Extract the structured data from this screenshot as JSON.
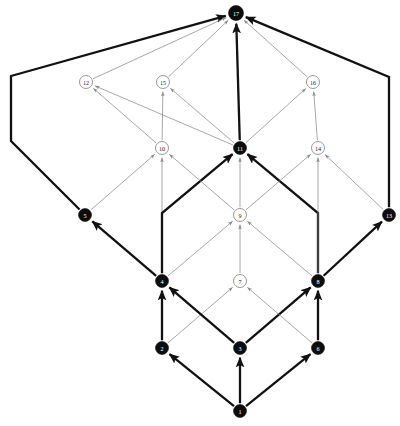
{
  "figure": {
    "title": "",
    "background_color": "#ffffff",
    "width": 400,
    "height": 426
  },
  "style": {
    "black_node_fill": "#0d0d0d",
    "black_node_label_color": "#ffffff",
    "white_node_fill": "#ffffff",
    "white_node_stroke": "#7d7d7d",
    "white_node_label_color": "#222222",
    "thin_edge_color": "#8a8a8a",
    "thick_edge_color": "#111111",
    "thin_edge_width": 0.75,
    "thick_edge_width": 2.3
  },
  "chart_data": {
    "type": "diagram",
    "subtype": "directed-acyclic-graph",
    "title": "",
    "node_count": 17,
    "edge_count": 34,
    "nodes": [
      {
        "id": 1,
        "label": "1",
        "x": 240,
        "y": 411,
        "fill": "black",
        "r": 6.5
      },
      {
        "id": 2,
        "label": "2",
        "x": 162,
        "y": 348,
        "fill": "black",
        "r": 6.5
      },
      {
        "id": 3,
        "label": "3",
        "x": 240,
        "y": 348,
        "fill": "black",
        "r": 6.5
      },
      {
        "id": 4,
        "label": "4",
        "x": 162,
        "y": 281,
        "fill": "black",
        "r": 6.5
      },
      {
        "id": 5,
        "label": "5",
        "x": 85,
        "y": 215,
        "fill": "black",
        "r": 6.5
      },
      {
        "id": 6,
        "label": "6",
        "x": 318,
        "y": 348,
        "fill": "black",
        "r": 6.5
      },
      {
        "id": 7,
        "label": "7",
        "x": 240,
        "y": 281,
        "fill": "white",
        "r": 6.5
      },
      {
        "id": 8,
        "label": "8",
        "x": 318,
        "y": 281,
        "fill": "black",
        "r": 6.5
      },
      {
        "id": 9,
        "label": "9",
        "x": 240,
        "y": 215,
        "fill": "white",
        "r": 6.5
      },
      {
        "id": 10,
        "label": "10",
        "x": 162,
        "y": 148,
        "fill": "white",
        "r": 6.5
      },
      {
        "id": 11,
        "label": "11",
        "x": 240,
        "y": 148,
        "fill": "black",
        "r": 6.5
      },
      {
        "id": 12,
        "label": "12",
        "x": 86,
        "y": 82,
        "fill": "white",
        "r": 6.5
      },
      {
        "id": 13,
        "label": "13",
        "x": 389,
        "y": 215,
        "fill": "black",
        "r": 6.5
      },
      {
        "id": 14,
        "label": "14",
        "x": 318,
        "y": 148,
        "fill": "white",
        "r": 6.5
      },
      {
        "id": 15,
        "label": "15",
        "x": 163,
        "y": 82,
        "fill": "white",
        "r": 6.5
      },
      {
        "id": 16,
        "label": "16",
        "x": 313,
        "y": 82,
        "fill": "white",
        "r": 6.5
      },
      {
        "id": 17,
        "label": "17",
        "x": 236,
        "y": 13,
        "fill": "black",
        "r": 7.5
      }
    ],
    "edges": [
      {
        "from": 1,
        "to": 2,
        "weight": "thick",
        "shape": "straight"
      },
      {
        "from": 1,
        "to": 3,
        "weight": "thick",
        "shape": "straight"
      },
      {
        "from": 1,
        "to": 6,
        "weight": "thick",
        "shape": "straight"
      },
      {
        "from": 2,
        "to": 4,
        "weight": "thick",
        "shape": "straight"
      },
      {
        "from": 2,
        "to": 7,
        "weight": "thin",
        "shape": "straight"
      },
      {
        "from": 3,
        "to": 4,
        "weight": "thick",
        "shape": "straight"
      },
      {
        "from": 3,
        "to": 8,
        "weight": "thick",
        "shape": "straight"
      },
      {
        "from": 6,
        "to": 7,
        "weight": "thin",
        "shape": "straight"
      },
      {
        "from": 6,
        "to": 8,
        "weight": "thick",
        "shape": "straight"
      },
      {
        "from": 4,
        "to": 5,
        "weight": "thick",
        "shape": "straight"
      },
      {
        "from": 4,
        "to": 9,
        "weight": "thin",
        "shape": "straight"
      },
      {
        "from": 4,
        "to": 10,
        "weight": "thin",
        "shape": "straight"
      },
      {
        "from": 4,
        "to": 11,
        "weight": "thick",
        "shape": "elbow-up-right"
      },
      {
        "from": 7,
        "to": 9,
        "weight": "thin",
        "shape": "straight"
      },
      {
        "from": 8,
        "to": 9,
        "weight": "thin",
        "shape": "straight"
      },
      {
        "from": 8,
        "to": 11,
        "weight": "thick",
        "shape": "elbow-up-left"
      },
      {
        "from": 8,
        "to": 13,
        "weight": "thick",
        "shape": "straight"
      },
      {
        "from": 8,
        "to": 14,
        "weight": "thin",
        "shape": "straight"
      },
      {
        "from": 9,
        "to": 10,
        "weight": "thin",
        "shape": "straight"
      },
      {
        "from": 9,
        "to": 11,
        "weight": "thin",
        "shape": "straight"
      },
      {
        "from": 9,
        "to": 14,
        "weight": "thin",
        "shape": "straight"
      },
      {
        "from": 5,
        "to": 10,
        "weight": "thin",
        "shape": "straight"
      },
      {
        "from": 5,
        "to": 17,
        "weight": "thick",
        "shape": "elbow-left-up"
      },
      {
        "from": 13,
        "to": 14,
        "weight": "thin",
        "shape": "straight"
      },
      {
        "from": 13,
        "to": 17,
        "weight": "thick",
        "shape": "elbow-right-up"
      },
      {
        "from": 10,
        "to": 12,
        "weight": "thin",
        "shape": "straight"
      },
      {
        "from": 10,
        "to": 15,
        "weight": "thin",
        "shape": "straight"
      },
      {
        "from": 11,
        "to": 12,
        "weight": "thin",
        "shape": "straight"
      },
      {
        "from": 11,
        "to": 15,
        "weight": "thin",
        "shape": "straight"
      },
      {
        "from": 11,
        "to": 16,
        "weight": "thin",
        "shape": "straight"
      },
      {
        "from": 11,
        "to": 17,
        "weight": "thick",
        "shape": "straight"
      },
      {
        "from": 14,
        "to": 16,
        "weight": "thin",
        "shape": "straight"
      },
      {
        "from": 12,
        "to": 17,
        "weight": "thin",
        "shape": "straight"
      },
      {
        "from": 15,
        "to": 17,
        "weight": "thin",
        "shape": "straight"
      },
      {
        "from": 16,
        "to": 17,
        "weight": "thin",
        "shape": "straight"
      }
    ],
    "elbow_waypoints": {
      "4-11": [
        [
          162,
          281
        ],
        [
          162,
          213
        ],
        [
          240,
          148
        ]
      ],
      "8-11": [
        [
          318,
          281
        ],
        [
          318,
          213
        ],
        [
          240,
          148
        ]
      ],
      "5-17": [
        [
          85,
          215
        ],
        [
          11,
          141
        ],
        [
          11,
          76
        ],
        [
          236,
          13
        ]
      ],
      "13-17": [
        [
          389,
          215
        ],
        [
          389,
          77
        ],
        [
          236,
          13
        ]
      ]
    },
    "legend": [],
    "notes": ""
  }
}
